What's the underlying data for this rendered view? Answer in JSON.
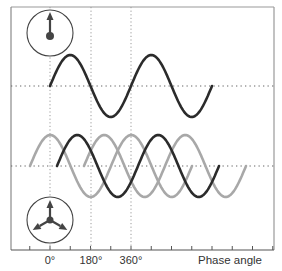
{
  "diagram": {
    "x_axis": {
      "label": "Phase angle",
      "ticks": [
        {
          "label": "0°",
          "x": 50
        },
        {
          "label": "180°",
          "x": 91
        },
        {
          "label": "360°",
          "x": 131
        }
      ],
      "px_per_360_deg": 81
    },
    "panels": [
      {
        "name": "single-phase",
        "midline_y": 86,
        "amplitude": 31,
        "phasor": {
          "type": "single",
          "cx": 50,
          "cy": 33,
          "r": 23
        },
        "waves": [
          {
            "name": "phase-1",
            "color": "#2b2b2b",
            "start_x": 50,
            "end_x": 212,
            "phase_deg": 0
          }
        ]
      },
      {
        "name": "three-phase",
        "midline_y": 166,
        "amplitude": 31,
        "phasor": {
          "type": "three",
          "cx": 50,
          "cy": 220,
          "r": 23
        },
        "waves": [
          {
            "name": "phase-a",
            "color": "#a8a8a8",
            "start_x": 30,
            "end_x": 192
          },
          {
            "name": "phase-b",
            "color": "#2b2b2b",
            "start_x": 57,
            "end_x": 219
          },
          {
            "name": "phase-c",
            "color": "#a8a8a8",
            "start_x": 84,
            "end_x": 246
          }
        ]
      }
    ],
    "colors": {
      "frame": "#8a8a8a",
      "dark_wave": "#2b2b2b",
      "light_wave": "#a8a8a8",
      "dotted": "#9a9a9a"
    }
  }
}
